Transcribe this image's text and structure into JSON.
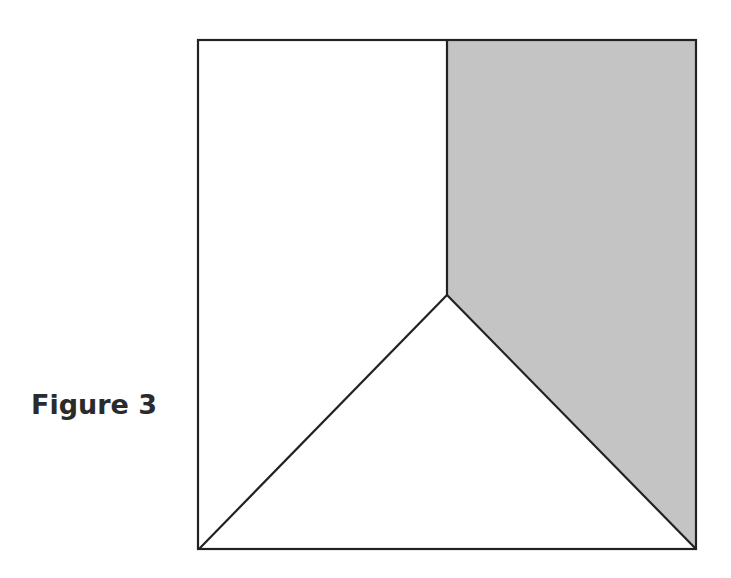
{
  "figure": {
    "label": "Figure 3",
    "label_color": "#2b2b2b"
  },
  "diagram": {
    "square": {
      "x1": 198,
      "y1": 40,
      "x2": 696,
      "y2": 549
    },
    "interior_point": {
      "x": 447,
      "y": 295
    },
    "top_midpoint": {
      "x": 447,
      "y": 40
    },
    "shaded_region_fill": "#c4c4c4",
    "stroke_color": "#222222",
    "background_fill": "#ffffff",
    "regions": [
      {
        "name": "left-pentagon",
        "shaded": false
      },
      {
        "name": "shaded-right-region",
        "shaded": true
      },
      {
        "name": "bottom-triangle",
        "shaded": false
      }
    ]
  }
}
